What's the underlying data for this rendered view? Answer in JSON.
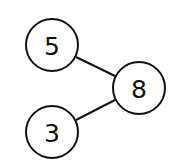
{
  "diagram": {
    "type": "tree",
    "nodes": [
      {
        "id": "n5",
        "label": "5",
        "cx": 52,
        "cy": 45,
        "r": 26
      },
      {
        "id": "n8",
        "label": "8",
        "cx": 139,
        "cy": 88,
        "r": 26
      },
      {
        "id": "n3",
        "label": "3",
        "cx": 52,
        "cy": 132,
        "r": 26
      }
    ],
    "edges": [
      {
        "from": "n5",
        "to": "n8"
      },
      {
        "from": "n3",
        "to": "n8"
      }
    ],
    "colors": {
      "stroke": "#111111",
      "fill": "#ffffff",
      "background": "#ffffff"
    }
  }
}
